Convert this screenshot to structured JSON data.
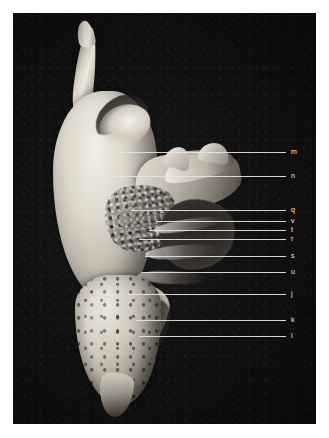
{
  "figure": {
    "kind": "anatomical-specimen-photograph",
    "background_color": "#ffffff",
    "plate_color": "#100f10",
    "label_color": "#efece5",
    "leader_color": "#e9e6df",
    "labels": [
      {
        "id": "m",
        "text": "m",
        "y": 152,
        "line_start_x": 116,
        "line_end_x": 286,
        "label_x": 291
      },
      {
        "id": "n",
        "text": "n",
        "y": 176,
        "line_start_x": 112,
        "line_end_x": 286,
        "label_x": 291
      },
      {
        "id": "q",
        "text": "q",
        "y": 210,
        "line_start_x": 131,
        "line_end_x": 286,
        "label_x": 291
      },
      {
        "id": "v",
        "text": "v",
        "y": 221,
        "line_start_x": 156,
        "line_end_x": 286,
        "label_x": 291
      },
      {
        "id": "t",
        "text": "t",
        "y": 230,
        "line_start_x": 149,
        "line_end_x": 286,
        "label_x": 291
      },
      {
        "id": "r",
        "text": "r",
        "y": 239,
        "line_start_x": 139,
        "line_end_x": 286,
        "label_x": 291
      },
      {
        "id": "s",
        "text": "s",
        "y": 256,
        "line_start_x": 145,
        "line_end_x": 286,
        "label_x": 291
      },
      {
        "id": "u",
        "text": "u",
        "y": 272,
        "line_start_x": 141,
        "line_end_x": 286,
        "label_x": 291
      },
      {
        "id": "j",
        "text": "j",
        "y": 294,
        "line_start_x": 128,
        "line_end_x": 286,
        "label_x": 291
      },
      {
        "id": "k",
        "text": "k",
        "y": 320,
        "line_start_x": 136,
        "line_end_x": 286,
        "label_x": 291
      },
      {
        "id": "i",
        "text": "i",
        "y": 336,
        "line_start_x": 139,
        "line_end_x": 286,
        "label_x": 291
      }
    ]
  }
}
